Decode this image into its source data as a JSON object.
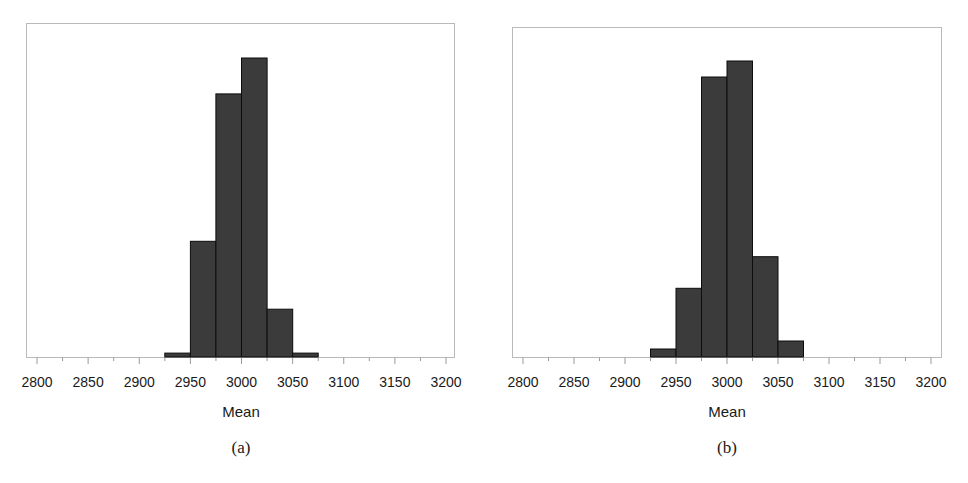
{
  "chart_data": [
    {
      "type": "bar",
      "subtype": "histogram",
      "title": "",
      "caption": "(a)",
      "xlabel": "Mean",
      "ylabel": "",
      "xlim": [
        2785,
        3210
      ],
      "x_ticks": [
        2800,
        2850,
        2900,
        2950,
        3000,
        3050,
        3100,
        3150,
        3200
      ],
      "x_minor_ticks": [
        2825,
        2875,
        2925,
        2975,
        3025,
        3075,
        3125,
        3175
      ],
      "bin_width": 25,
      "bins": [
        [
          2925,
          2950
        ],
        [
          2950,
          2975
        ],
        [
          2975,
          3000
        ],
        [
          3000,
          3025
        ],
        [
          3025,
          3050
        ],
        [
          3050,
          3075
        ]
      ],
      "categories": [
        "2925-2950",
        "2950-2975",
        "2975-3000",
        "3000-3025",
        "3025-3050",
        "3050-3075"
      ],
      "values": [
        1.3,
        38.7,
        88.0,
        100.0,
        16.0,
        1.3
      ],
      "value_units": "relative frequency (% of tallest bar; y-axis unlabeled)",
      "ylim": [
        0,
        112
      ],
      "grid": false,
      "legend": null
    },
    {
      "type": "bar",
      "subtype": "histogram",
      "title": "",
      "caption": "(b)",
      "xlabel": "Mean",
      "ylabel": "",
      "xlim": [
        2785,
        3210
      ],
      "x_ticks": [
        2800,
        2850,
        2900,
        2950,
        3000,
        3050,
        3100,
        3150,
        3200
      ],
      "x_minor_ticks": [
        2825,
        2875,
        2925,
        2975,
        3025,
        3075,
        3125,
        3175
      ],
      "bin_width": 25,
      "bins": [
        [
          2925,
          2950
        ],
        [
          2950,
          2975
        ],
        [
          2975,
          3000
        ],
        [
          3000,
          3025
        ],
        [
          3025,
          3050
        ],
        [
          3050,
          3075
        ]
      ],
      "categories": [
        "2925-2950",
        "2950-2975",
        "2975-3000",
        "3000-3025",
        "3025-3050",
        "3050-3075"
      ],
      "values": [
        2.7,
        23.2,
        94.6,
        100.0,
        33.9,
        5.4
      ],
      "value_units": "relative frequency (% of tallest bar; y-axis unlabeled)",
      "ylim": [
        0,
        110
      ],
      "grid": false,
      "legend": null
    }
  ],
  "panels": [
    {
      "caption": "(a)",
      "xlabel": "Mean",
      "tick_labels": [
        "2800",
        "2850",
        "2900",
        "2950",
        "3000",
        "3050",
        "3100",
        "3150",
        "3200"
      ]
    },
    {
      "caption": "(b)",
      "xlabel": "Mean",
      "tick_labels": [
        "2800",
        "2850",
        "2900",
        "2950",
        "3000",
        "3050",
        "3100",
        "3150",
        "3200"
      ]
    }
  ],
  "colors": {
    "bar_fill": "#3b3b3b",
    "bar_stroke": "#0d0d0d",
    "frame": "#b9b9b9",
    "axis": "#9a9a9a",
    "text": "#1a1a1a"
  }
}
